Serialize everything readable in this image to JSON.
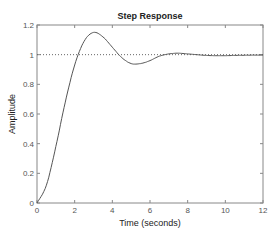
{
  "chart_data": {
    "type": "line",
    "title": "Step Response",
    "xlabel": "Time (seconds)",
    "ylabel": "Amplitude",
    "xlim": [
      0,
      12
    ],
    "ylim": [
      0,
      1.2
    ],
    "xticks": [
      "0",
      "2",
      "4",
      "6",
      "8",
      "10",
      "12"
    ],
    "yticks": [
      "0",
      "0.2",
      "0.4",
      "0.6",
      "0.8",
      "1",
      "1.2"
    ],
    "grid": false,
    "reference_line": {
      "y": 1,
      "style": "dotted"
    },
    "series": [
      {
        "name": "Step Response",
        "x": [
          0,
          0.5,
          1,
          1.5,
          2,
          2.5,
          3,
          3.5,
          4,
          4.5,
          5,
          5.5,
          6,
          6.5,
          7,
          7.5,
          8,
          8.5,
          9,
          9.5,
          10,
          10.5,
          11,
          11.5,
          12
        ],
        "y": [
          0,
          0.12,
          0.38,
          0.68,
          0.93,
          1.09,
          1.15,
          1.12,
          1.05,
          0.98,
          0.94,
          0.94,
          0.96,
          0.99,
          1.005,
          1.01,
          1.005,
          1.0,
          0.995,
          0.993,
          0.993,
          0.995,
          0.996,
          0.997,
          0.997
        ]
      }
    ]
  }
}
